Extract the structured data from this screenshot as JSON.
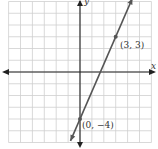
{
  "chart_data": {
    "type": "line",
    "title": "",
    "xlabel": "x",
    "ylabel": "y",
    "xlim": [
      -6,
      6
    ],
    "ylim": [
      -6,
      6
    ],
    "grid": true,
    "line": {
      "slope": 2.3333,
      "intercept": -4,
      "x_range": [
        -0.8,
        4.4
      ]
    },
    "points": [
      {
        "x": 0,
        "y": -4,
        "label": "(0, −4)"
      },
      {
        "x": 3,
        "y": 3,
        "label": "(3, 3)"
      }
    ],
    "colors": {
      "line": "#555555",
      "grid": "#cfcfcf",
      "axis": "#222222"
    }
  }
}
